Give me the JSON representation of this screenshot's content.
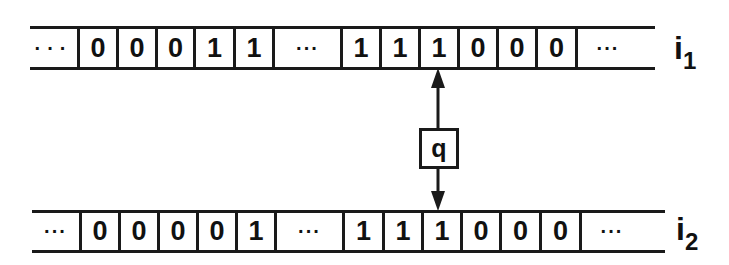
{
  "diagram": {
    "type": "two-tape automaton head",
    "tapes": [
      {
        "id": "i1",
        "label_main": "i",
        "label_sub": "1",
        "cells": [
          "···",
          "0",
          "0",
          "0",
          "1",
          "1",
          "···",
          "1",
          "1",
          "1",
          "0",
          "0",
          "0",
          "···"
        ],
        "head_position_index": 9
      },
      {
        "id": "i2",
        "label_main": "i",
        "label_sub": "2",
        "cells": [
          "···",
          "0",
          "0",
          "0",
          "0",
          "1",
          "···",
          "1",
          "1",
          "1",
          "0",
          "0",
          "0",
          "···"
        ],
        "head_position_index": 9
      }
    ],
    "head": {
      "state_label": "q",
      "connections": [
        "i1",
        "i2"
      ]
    }
  }
}
